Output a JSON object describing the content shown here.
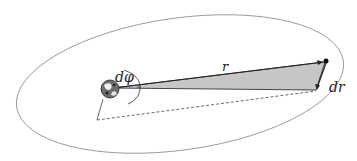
{
  "diagram": {
    "type": "orbital-geometry",
    "labels": {
      "angle": "dφ",
      "radius": "r",
      "radial_change": "dr"
    },
    "elements": {
      "orbit": "ellipse",
      "central_body": "earth-globe",
      "orbiting_body": "satellite-point",
      "swept_area": "shaded-triangle"
    },
    "colors": {
      "orbit_stroke": "#7a7a7a",
      "swept_fill": "#c4c4c4",
      "line": "#333333"
    }
  }
}
